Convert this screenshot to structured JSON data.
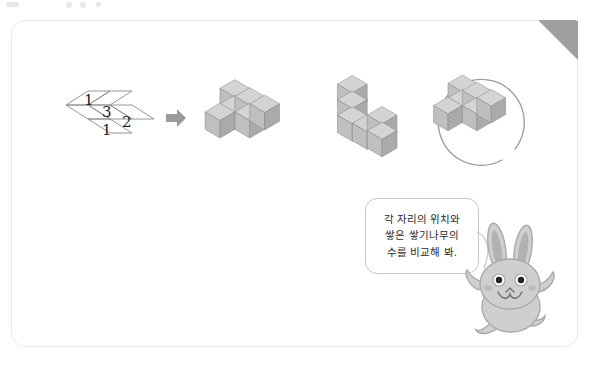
{
  "card": {
    "dogear_name": "folded page corner"
  },
  "grid": {
    "title": "numbered position grid",
    "cells": [
      {
        "label": "1",
        "x": 18,
        "y": 8
      },
      {
        "label": "3",
        "x": 38,
        "y": 22
      },
      {
        "label": "2",
        "x": 58,
        "y": 31
      },
      {
        "label": "1",
        "x": 38,
        "y": 42
      }
    ]
  },
  "arrow": {
    "icon": "arrow-right-icon",
    "color": "#9a9a9a"
  },
  "figures": [
    {
      "id": "stack-a",
      "name": "cube-stack-first",
      "circled": false,
      "cubes": [
        {
          "col": 0,
          "row": 1,
          "level": 0
        },
        {
          "col": 1,
          "row": 1,
          "level": 0
        },
        {
          "col": 1,
          "row": 0,
          "level": 0
        },
        {
          "col": 1,
          "row": 0,
          "level": 1
        },
        {
          "col": 2,
          "row": 0,
          "level": 0
        },
        {
          "col": 2,
          "row": 1,
          "level": 0
        }
      ]
    },
    {
      "id": "stack-b",
      "name": "cube-stack-second",
      "circled": false,
      "cubes": []
    },
    {
      "id": "stack-c",
      "name": "cube-stack-third-circled",
      "circled": true,
      "cubes": []
    }
  ],
  "hint": {
    "bubble_name": "hint-speech-bubble",
    "lines": [
      "각 자리의 위치와",
      "쌓은 쌓기나무의",
      "수를 비교해 봐."
    ]
  },
  "character": {
    "name": "rabbit-mascot",
    "body_color": "#c9c9c9",
    "ear_inner_color": "#b0b0b0"
  },
  "colors": {
    "card_border": "#eaeaea",
    "cube_top": "#d4d4d4",
    "cube_left": "#bfbfbf",
    "cube_right": "#a8a8a8",
    "cube_stroke": "#8a8a8a",
    "circle_stroke": "#9a9a9a",
    "ink": "#1e1e1e"
  }
}
